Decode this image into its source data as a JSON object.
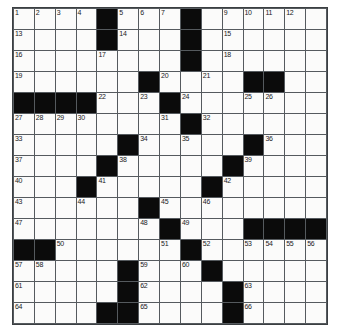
{
  "puzzle": {
    "kind": "crossword-grid",
    "rows": 15,
    "cols": 15,
    "colors": {
      "block": "#0b0b0b",
      "open": "#fbfbfa",
      "grid_line": "#555a5e",
      "border": "#3b3f42",
      "number_text": "#1a1a1a"
    },
    "blocks": [
      [
        0,
        4
      ],
      [
        0,
        8
      ],
      [
        1,
        4
      ],
      [
        1,
        8
      ],
      [
        2,
        8
      ],
      [
        3,
        6
      ],
      [
        3,
        11
      ],
      [
        3,
        12
      ],
      [
        4,
        0
      ],
      [
        4,
        1
      ],
      [
        4,
        2
      ],
      [
        4,
        3
      ],
      [
        4,
        7
      ],
      [
        5,
        8
      ],
      [
        6,
        5
      ],
      [
        6,
        11
      ],
      [
        7,
        4
      ],
      [
        7,
        10
      ],
      [
        8,
        3
      ],
      [
        8,
        9
      ],
      [
        9,
        6
      ],
      [
        10,
        7
      ],
      [
        10,
        11
      ],
      [
        10,
        12
      ],
      [
        10,
        13
      ],
      [
        10,
        14
      ],
      [
        11,
        0
      ],
      [
        11,
        1
      ],
      [
        11,
        8
      ],
      [
        12,
        5
      ],
      [
        12,
        9
      ],
      [
        13,
        5
      ],
      [
        13,
        10
      ],
      [
        14,
        4
      ],
      [
        14,
        5
      ],
      [
        14,
        10
      ]
    ],
    "numbers": [
      {
        "r": 0,
        "c": 0,
        "n": "1"
      },
      {
        "r": 0,
        "c": 1,
        "n": "2"
      },
      {
        "r": 0,
        "c": 2,
        "n": "3"
      },
      {
        "r": 0,
        "c": 3,
        "n": "4"
      },
      {
        "r": 0,
        "c": 5,
        "n": "5"
      },
      {
        "r": 0,
        "c": 6,
        "n": "6"
      },
      {
        "r": 0,
        "c": 7,
        "n": "7"
      },
      {
        "r": 0,
        "c": 8,
        "n": "8"
      },
      {
        "r": 0,
        "c": 10,
        "n": "9"
      },
      {
        "r": 0,
        "c": 11,
        "n": "10"
      },
      {
        "r": 0,
        "c": 12,
        "n": "11"
      },
      {
        "r": 0,
        "c": 13,
        "n": "12"
      },
      {
        "r": 1,
        "c": 0,
        "n": "13"
      },
      {
        "r": 1,
        "c": 5,
        "n": "14"
      },
      {
        "r": 1,
        "c": 10,
        "n": "15"
      },
      {
        "r": 2,
        "c": 0,
        "n": "16"
      },
      {
        "r": 2,
        "c": 4,
        "n": "17"
      },
      {
        "r": 2,
        "c": 10,
        "n": "18"
      },
      {
        "r": 3,
        "c": 0,
        "n": "19"
      },
      {
        "r": 3,
        "c": 7,
        "n": "20"
      },
      {
        "r": 3,
        "c": 9,
        "n": "21"
      },
      {
        "r": 4,
        "c": 4,
        "n": "22"
      },
      {
        "r": 4,
        "c": 6,
        "n": "23"
      },
      {
        "r": 4,
        "c": 8,
        "n": "24"
      },
      {
        "r": 4,
        "c": 11,
        "n": "25"
      },
      {
        "r": 4,
        "c": 12,
        "n": "26"
      },
      {
        "r": 5,
        "c": 0,
        "n": "27"
      },
      {
        "r": 5,
        "c": 1,
        "n": "28"
      },
      {
        "r": 5,
        "c": 2,
        "n": "29"
      },
      {
        "r": 5,
        "c": 3,
        "n": "30"
      },
      {
        "r": 5,
        "c": 7,
        "n": "31"
      },
      {
        "r": 5,
        "c": 9,
        "n": "32"
      },
      {
        "r": 6,
        "c": 0,
        "n": "33"
      },
      {
        "r": 6,
        "c": 6,
        "n": "34"
      },
      {
        "r": 6,
        "c": 8,
        "n": "35"
      },
      {
        "r": 6,
        "c": 12,
        "n": "36"
      },
      {
        "r": 7,
        "c": 0,
        "n": "37"
      },
      {
        "r": 7,
        "c": 5,
        "n": "38"
      },
      {
        "r": 7,
        "c": 11,
        "n": "39"
      },
      {
        "r": 8,
        "c": 0,
        "n": "40"
      },
      {
        "r": 8,
        "c": 4,
        "n": "41"
      },
      {
        "r": 8,
        "c": 10,
        "n": "42"
      },
      {
        "r": 9,
        "c": 0,
        "n": "43"
      },
      {
        "r": 9,
        "c": 3,
        "n": "44"
      },
      {
        "r": 9,
        "c": 7,
        "n": "45"
      },
      {
        "r": 9,
        "c": 9,
        "n": "46"
      },
      {
        "r": 10,
        "c": 0,
        "n": "47"
      },
      {
        "r": 10,
        "c": 6,
        "n": "48"
      },
      {
        "r": 10,
        "c": 8,
        "n": "49"
      },
      {
        "r": 11,
        "c": 2,
        "n": "50"
      },
      {
        "r": 11,
        "c": 7,
        "n": "51"
      },
      {
        "r": 11,
        "c": 9,
        "n": "52"
      },
      {
        "r": 11,
        "c": 11,
        "n": "53"
      },
      {
        "r": 11,
        "c": 12,
        "n": "54"
      },
      {
        "r": 11,
        "c": 13,
        "n": "55"
      },
      {
        "r": 11,
        "c": 14,
        "n": "56"
      },
      {
        "r": 12,
        "c": 0,
        "n": "57"
      },
      {
        "r": 12,
        "c": 1,
        "n": "58"
      },
      {
        "r": 12,
        "c": 6,
        "n": "59"
      },
      {
        "r": 12,
        "c": 8,
        "n": "60"
      },
      {
        "r": 13,
        "c": 0,
        "n": "61"
      },
      {
        "r": 13,
        "c": 6,
        "n": "62"
      },
      {
        "r": 13,
        "c": 11,
        "n": "63"
      },
      {
        "r": 14,
        "c": 0,
        "n": "64"
      },
      {
        "r": 14,
        "c": 6,
        "n": "65"
      },
      {
        "r": 14,
        "c": 11,
        "n": "66"
      }
    ],
    "letters": []
  }
}
